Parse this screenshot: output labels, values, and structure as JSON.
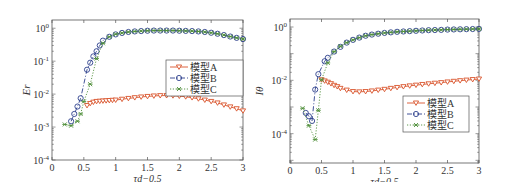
{
  "colors": {
    "modelA": "#d9532b",
    "modelB": "#2c3f8c",
    "modelC": "#4f8f3a",
    "axis": "#555555"
  },
  "chart_data": [
    {
      "type": "line",
      "title": "",
      "xlabel": "τd−0.5",
      "ylabel": "Er",
      "yscale": "log",
      "xlim": [
        0,
        3
      ],
      "ylim": [
        0.0001,
        1
      ],
      "xticks": [
        "0",
        "0.5",
        "1",
        "1.5",
        "2",
        "2.5",
        "3"
      ],
      "yticks": [
        "10^-4",
        "10^-3",
        "10^-2",
        "10^-1",
        "10^0"
      ],
      "legend": {
        "position": "center-right",
        "entries": [
          "模型A",
          "模型B",
          "模型C"
        ]
      },
      "series": [
        {
          "name": "模型A",
          "style": "solid, downward-triangle markers",
          "x": [
            0.55,
            0.6,
            0.65,
            0.7,
            0.75,
            0.8,
            0.85,
            0.9,
            0.95,
            1.0,
            1.1,
            1.2,
            1.3,
            1.4,
            1.5,
            1.6,
            1.7,
            1.8,
            1.9,
            2.0,
            2.1,
            2.2,
            2.3,
            2.4,
            2.5,
            2.6,
            2.7,
            2.8,
            2.9,
            3.0
          ],
          "y": [
            0.0045,
            0.0052,
            0.0057,
            0.006,
            0.0061,
            0.0062,
            0.0063,
            0.0064,
            0.0065,
            0.0066,
            0.007,
            0.0074,
            0.0078,
            0.0082,
            0.0085,
            0.0088,
            0.009,
            0.009,
            0.0089,
            0.0087,
            0.0083,
            0.0078,
            0.0072,
            0.0066,
            0.006,
            0.0054,
            0.0047,
            0.0041,
            0.0036,
            0.0031
          ]
        },
        {
          "name": "模型B",
          "style": "dash-dot, circle markers",
          "x": [
            0.3,
            0.35,
            0.4,
            0.45,
            0.55,
            0.6,
            0.65,
            0.7,
            0.75,
            0.8,
            0.9,
            1.0,
            1.1,
            1.2,
            1.3,
            1.4,
            1.5,
            1.6,
            1.7,
            1.8,
            1.9,
            2.0,
            2.1,
            2.2,
            2.3,
            2.4,
            2.5,
            2.6,
            2.7,
            2.8,
            2.9,
            3.0
          ],
          "y": [
            0.0015,
            0.0025,
            0.0042,
            0.0075,
            0.055,
            0.09,
            0.14,
            0.2,
            0.3,
            0.42,
            0.55,
            0.65,
            0.72,
            0.77,
            0.8,
            0.82,
            0.84,
            0.85,
            0.85,
            0.85,
            0.85,
            0.84,
            0.83,
            0.82,
            0.8,
            0.77,
            0.73,
            0.68,
            0.62,
            0.56,
            0.51,
            0.47
          ]
        },
        {
          "name": "模型C",
          "style": "dotted, asterisk markers",
          "x": [
            0.2,
            0.3,
            0.4,
            0.45,
            0.5,
            0.6,
            0.7,
            0.8,
            0.9,
            1.0,
            1.1,
            1.2,
            1.3,
            1.4,
            1.5,
            1.6,
            1.7,
            1.8,
            1.9,
            2.0,
            2.1,
            2.2,
            2.3,
            2.4,
            2.5,
            2.6,
            2.7,
            2.8,
            2.9,
            3.0
          ],
          "y": [
            0.0012,
            0.0011,
            0.0015,
            0.0025,
            0.006,
            0.02,
            0.12,
            0.35,
            0.55,
            0.66,
            0.72,
            0.77,
            0.8,
            0.82,
            0.84,
            0.85,
            0.85,
            0.85,
            0.85,
            0.84,
            0.83,
            0.82,
            0.8,
            0.77,
            0.73,
            0.68,
            0.62,
            0.56,
            0.51,
            0.47
          ]
        }
      ]
    },
    {
      "type": "line",
      "title": "",
      "xlabel": "τd−0.5",
      "ylabel": "Iθ",
      "yscale": "log",
      "xlim": [
        0,
        3
      ],
      "ylim": [
        8e-06,
        1.2
      ],
      "xticks": [
        "0",
        "0.5",
        "1",
        "1.5",
        "2",
        "2.5",
        "3"
      ],
      "yticks": [
        "10^-4",
        "10^-2",
        "10^0"
      ],
      "legend": {
        "position": "lower-right",
        "entries": [
          "模型A",
          "模型B",
          "模型C"
        ]
      },
      "series": [
        {
          "name": "模型A",
          "style": "solid, downward-triangle markers",
          "x": [
            0.5,
            0.55,
            0.6,
            0.65,
            0.7,
            0.75,
            0.8,
            0.9,
            1.0,
            1.1,
            1.2,
            1.3,
            1.4,
            1.5,
            1.6,
            1.7,
            1.8,
            1.9,
            2.0,
            2.1,
            2.2,
            2.3,
            2.4,
            2.5,
            2.6,
            2.7,
            2.8,
            2.9,
            3.0
          ],
          "y": [
            0.0105,
            0.0095,
            0.0085,
            0.0075,
            0.0065,
            0.0058,
            0.005,
            0.0043,
            0.0038,
            0.0037,
            0.0038,
            0.004,
            0.0043,
            0.0046,
            0.005,
            0.0054,
            0.0058,
            0.0062,
            0.0066,
            0.007,
            0.0074,
            0.0078,
            0.0082,
            0.0087,
            0.0092,
            0.0097,
            0.0102,
            0.0107,
            0.0112
          ]
        },
        {
          "name": "模型B",
          "style": "dash-dot, circle markers",
          "x": [
            0.25,
            0.3,
            0.35,
            0.4,
            0.45,
            0.55,
            0.6,
            0.7,
            0.8,
            0.9,
            1.0,
            1.1,
            1.2,
            1.3,
            1.4,
            1.5,
            1.6,
            1.7,
            1.8,
            1.9,
            2.0,
            2.1,
            2.2,
            2.3,
            2.4,
            2.5,
            2.6,
            2.7,
            2.8,
            2.9,
            3.0
          ],
          "y": [
            0.0006,
            0.00045,
            0.0003,
            0.0045,
            0.017,
            0.052,
            0.07,
            0.12,
            0.18,
            0.26,
            0.33,
            0.4,
            0.47,
            0.52,
            0.56,
            0.6,
            0.63,
            0.66,
            0.68,
            0.7,
            0.72,
            0.74,
            0.76,
            0.77,
            0.78,
            0.8,
            0.81,
            0.82,
            0.83,
            0.84,
            0.85
          ]
        },
        {
          "name": "模型C",
          "style": "dotted, asterisk markers",
          "x": [
            0.2,
            0.3,
            0.4,
            0.45,
            0.5,
            0.6,
            0.7,
            0.8,
            0.9,
            1.0,
            1.1,
            1.2,
            1.3,
            1.4,
            1.5,
            1.6,
            1.7,
            1.8,
            1.9,
            2.0,
            2.1,
            2.2,
            2.3,
            2.4,
            2.5,
            2.6,
            2.7,
            2.8,
            2.9,
            3.0
          ],
          "y": [
            0.0009,
            0.0002,
            6e-05,
            0.00075,
            0.0105,
            0.045,
            0.12,
            0.19,
            0.26,
            0.33,
            0.4,
            0.47,
            0.52,
            0.56,
            0.6,
            0.63,
            0.66,
            0.68,
            0.7,
            0.72,
            0.74,
            0.76,
            0.77,
            0.78,
            0.8,
            0.81,
            0.82,
            0.83,
            0.84,
            0.85
          ]
        }
      ]
    }
  ]
}
